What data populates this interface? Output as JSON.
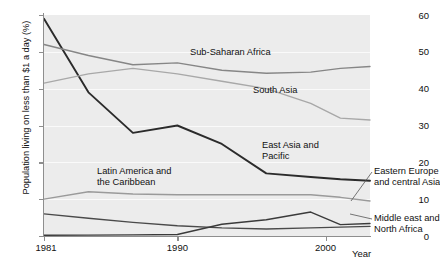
{
  "chart_data": {
    "type": "line",
    "title": "",
    "xlabel": "Year",
    "ylabel": "Population living on less than $1 a day (%)",
    "xlim": [
      1981,
      2003
    ],
    "ylim": [
      0,
      60
    ],
    "xticks": [
      1981,
      1990,
      2000
    ],
    "xticklabels": [
      "1981",
      "1990",
      "2000"
    ],
    "yticks": [
      0,
      10,
      20,
      30,
      40,
      50,
      60
    ],
    "yticklabels": [
      "0",
      "10",
      "20",
      "30",
      "40",
      "50",
      "60"
    ],
    "grid": true,
    "legend_position": "inline-annotations",
    "series": [
      {
        "name": "East Asia and Pacific",
        "color": "#2b2b2b",
        "x": [
          1981,
          1984,
          1987,
          1990,
          1993,
          1996,
          1999,
          2001,
          2003
        ],
        "y": [
          59,
          39,
          28,
          30,
          25,
          17,
          16,
          15.4,
          15
        ]
      },
      {
        "name": "Sub-Saharan Africa",
        "color": "#868686",
        "x": [
          1981,
          1984,
          1987,
          1990,
          1993,
          1996,
          1999,
          2001,
          2003
        ],
        "y": [
          52,
          49,
          46.5,
          47,
          45,
          44.2,
          44.5,
          45.5,
          46
        ]
      },
      {
        "name": "South Asia",
        "color": "#a8a8a8",
        "x": [
          1981,
          1984,
          1987,
          1990,
          1993,
          1996,
          1999,
          2001,
          2003
        ],
        "y": [
          41.5,
          44,
          45.5,
          44,
          42,
          40,
          36,
          32,
          31.5
        ]
      },
      {
        "name": "Latin America and the Caribbean",
        "color": "#9a9a9a",
        "x": [
          1981,
          1984,
          1987,
          1990,
          1993,
          1996,
          1999,
          2001,
          2003
        ],
        "y": [
          10,
          12,
          11.4,
          11.2,
          11.2,
          11.2,
          11.2,
          10.5,
          9.5
        ]
      },
      {
        "name": "Middle east and North Africa",
        "color": "#4a4a4a",
        "x": [
          1981,
          1984,
          1987,
          1990,
          1993,
          1996,
          1999,
          2001,
          2003
        ],
        "y": [
          6,
          4.8,
          3.7,
          2.8,
          2.2,
          1.9,
          2.2,
          2.4,
          2.6
        ]
      },
      {
        "name": "Eastern Europe and central Asia",
        "color": "#3a3a3a",
        "x": [
          1981,
          1984,
          1987,
          1990,
          1993,
          1996,
          1999,
          2001,
          2003
        ],
        "y": [
          0.2,
          0.25,
          0.3,
          0.4,
          3.2,
          4.4,
          6.5,
          3.1,
          3.4
        ]
      }
    ],
    "annotations": [
      {
        "key": "ssa",
        "text": "Sub-Saharan Africa"
      },
      {
        "key": "sa",
        "text": "South Asia"
      },
      {
        "key": "eap",
        "text": "East Asia and\nPacific"
      },
      {
        "key": "lac",
        "text": "Latin America and\nthe Caribbean"
      },
      {
        "key": "eeca",
        "text": "Eastern Europe\nand central Asia"
      },
      {
        "key": "mena",
        "text": "Middle east and\nNorth Africa"
      }
    ]
  },
  "axes": {
    "y_title": "Population living on less than $1 a day (%)",
    "x_title": "Year",
    "y_labels": [
      "60",
      "50",
      "40",
      "30",
      "20",
      "10",
      "0"
    ],
    "x_labels": [
      "1981",
      "1990",
      "2000"
    ]
  },
  "labels": {
    "sub_saharan_africa": "Sub-Saharan Africa",
    "south_asia": "South Asia",
    "east_asia_pacific_line1": "East Asia and",
    "east_asia_pacific_line2": "Pacific",
    "latin_america_line1": "Latin America and",
    "latin_america_line2": "the Caribbean",
    "eastern_europe_line1": "Eastern Europe",
    "eastern_europe_line2": "and central Asia",
    "middle_east_line1": "Middle east and",
    "middle_east_line2": "North Africa"
  },
  "colors": {
    "plot_background": "#ececec",
    "gridline": "#fafafa",
    "axis": "#8e8e8e",
    "east_asia": "#2b2b2b",
    "sub_saharan": "#868686",
    "south_asia": "#a8a8a8",
    "latin_america": "#9a9a9a",
    "middle_east": "#4a4a4a",
    "eastern_europe": "#3a3a3a"
  }
}
